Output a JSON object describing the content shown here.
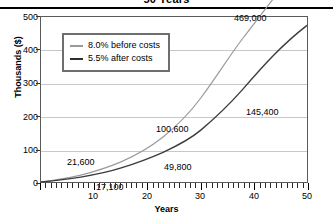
{
  "chart_data": {
    "type": "line",
    "title": "50 Years",
    "xlabel": "Years",
    "ylabel": "Thousands ($)",
    "xlim": [
      0,
      50
    ],
    "ylim": [
      0,
      500
    ],
    "xticks": [
      10,
      20,
      30,
      40,
      50
    ],
    "yticks": [
      0,
      100,
      200,
      300,
      400,
      500
    ],
    "grid": true,
    "legend_position": "upper-left-inside",
    "x": [
      0,
      5,
      10,
      15,
      20,
      25,
      30,
      35,
      40,
      45,
      50
    ],
    "series": [
      {
        "name": "8.0% before costs",
        "color": "#9a9a9a",
        "values": [
          0,
          6.1,
          15.1,
          28.4,
          47.9,
          76.5,
          118.6,
          180.4,
          271.1,
          404.3,
          469.0
        ]
      },
      {
        "name": "5.5% after costs",
        "color": "#3c3c3c",
        "values": [
          0,
          5.4,
          12.5,
          21.6,
          33.5,
          49.0,
          69.3,
          95.7,
          130.3,
          175.4,
          145.4
        ]
      }
    ],
    "annotations": [
      {
        "text": "21,600",
        "x": 15,
        "y": 21.6,
        "series": "5.5% after costs"
      },
      {
        "text": "17,100",
        "x": 15,
        "y": 17.1,
        "series": "8.0% before costs"
      },
      {
        "text": "100,600",
        "x": 30,
        "y": 100.6,
        "series": "8.0% before costs"
      },
      {
        "text": "49,800",
        "x": 30,
        "y": 49.8,
        "series": "5.5% after costs"
      },
      {
        "text": "469,000",
        "x": 50,
        "y": 469.0,
        "series": "8.0% before costs"
      },
      {
        "text": "145,400",
        "x": 50,
        "y": 145.4,
        "series": "5.5% after costs"
      }
    ]
  },
  "ytick_labels": [
    "500",
    "400",
    "300",
    "200",
    "100",
    "0"
  ],
  "xtick_labels": [
    "10",
    "20",
    "30",
    "40",
    "50"
  ],
  "legend": {
    "items": [
      {
        "label": "8.0% before costs"
      },
      {
        "label": "5.5% after costs"
      }
    ]
  },
  "annotation_labels": {
    "a1": "469,000",
    "a2": "145,400",
    "a3": "100,600",
    "a4": "49,800",
    "a5": "21,600",
    "a6": "17,100"
  }
}
